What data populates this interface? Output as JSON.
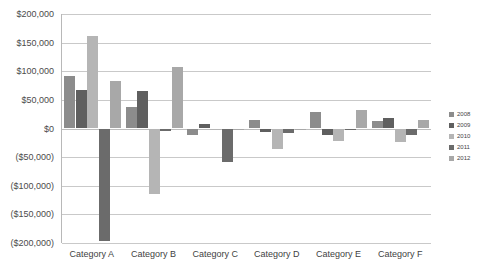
{
  "chart_data": {
    "type": "bar",
    "title": "",
    "xlabel": "",
    "ylabel": "",
    "grid": true,
    "legend_position": "right",
    "ylim": [
      -200000,
      200000
    ],
    "ytick_step": 50000,
    "ytick_labels": [
      "$200,000",
      "$150,000",
      "$100,000",
      "$50,000",
      "$0",
      "($50,000)",
      "($100,000)",
      "($150,000)",
      "($200,000)"
    ],
    "ytick_values": [
      200000,
      150000,
      100000,
      50000,
      0,
      -50000,
      -100000,
      -150000,
      -200000
    ],
    "categories": [
      "Category A",
      "Category B",
      "Category C",
      "Category D",
      "Category E",
      "Category F"
    ],
    "series": [
      {
        "name": "2008",
        "color": "#8c8c8c",
        "values": [
          92000,
          37000,
          -12000,
          14000,
          28000,
          13000
        ]
      },
      {
        "name": "2009",
        "color": "#5f5f5f",
        "values": [
          68000,
          65000,
          8000,
          -6000,
          -11000,
          19000
        ]
      },
      {
        "name": "2010",
        "color": "#b5b5b5",
        "values": [
          161000,
          -115000,
          -3000,
          -35000,
          -22000,
          -23000
        ]
      },
      {
        "name": "2011",
        "color": "#6b6b6b",
        "values": [
          -196000,
          -5000,
          -58000,
          -8000,
          -1000,
          -12000
        ]
      },
      {
        "name": "2012",
        "color": "#a8a8a8",
        "values": [
          83000,
          108000,
          -2000,
          -1000,
          33000,
          15000
        ]
      }
    ]
  },
  "legend": {
    "items": [
      {
        "label": "2008"
      },
      {
        "label": "2009"
      },
      {
        "label": "2010"
      },
      {
        "label": "2011"
      },
      {
        "label": "2012"
      }
    ]
  }
}
